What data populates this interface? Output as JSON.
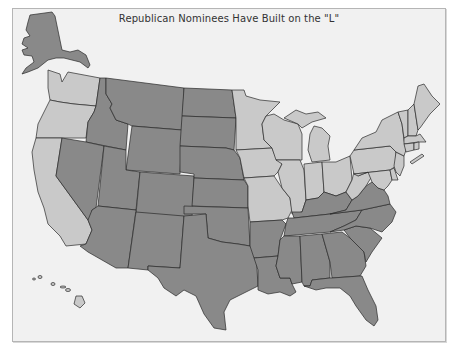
{
  "title": "Republican Nominees Have Built on the \"L\"",
  "colors": {
    "republican_l": "#898989",
    "other": "#c9c9c9",
    "background": "#f1f1f1",
    "border": "#2a2a2a"
  },
  "map": {
    "type": "choropleth-us-states",
    "categories": [
      {
        "name": "Republican \"L\" states",
        "color": "#898989",
        "states": [
          "AK",
          "ID",
          "MT",
          "WY",
          "ND",
          "SD",
          "NE",
          "KS",
          "OK",
          "TX",
          "NV",
          "UT",
          "CO",
          "AZ",
          "NM",
          "AR",
          "LA",
          "MS",
          "AL",
          "GA",
          "FL",
          "SC",
          "NC",
          "TN",
          "KY",
          "VA"
        ]
      },
      {
        "name": "Other states",
        "color": "#c9c9c9",
        "states": [
          "WA",
          "OR",
          "CA",
          "MN",
          "WI",
          "MI",
          "IA",
          "MO",
          "IL",
          "IN",
          "OH",
          "PA",
          "NY",
          "WV",
          "ME",
          "NH",
          "VT",
          "MA",
          "RI",
          "CT",
          "NJ",
          "DE",
          "MD",
          "HI"
        ]
      }
    ]
  }
}
